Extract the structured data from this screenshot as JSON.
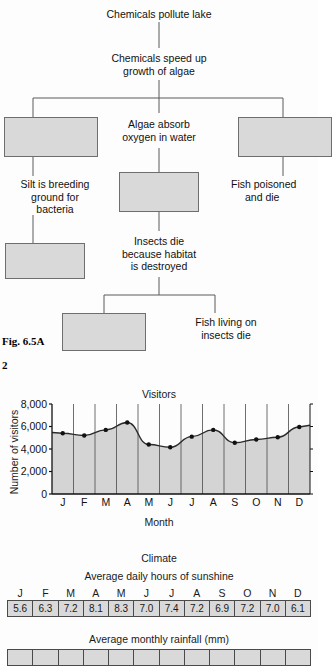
{
  "figure": {
    "caption": "Fig. 6.5A",
    "question_number": "2"
  },
  "flowchart": {
    "nodes": [
      {
        "id": "n1",
        "text": "Chemicals pollute lake"
      },
      {
        "id": "n2",
        "line1": "Chemicals speed up",
        "line2": "growth of algae"
      },
      {
        "id": "n3",
        "line1": "Algae absorb",
        "line2": "oxygen in water"
      },
      {
        "id": "n4",
        "line1": "Silt is breeding",
        "line2": "ground for",
        "line3": "bacteria"
      },
      {
        "id": "n5",
        "line1": "Fish poisoned",
        "line2": "and die"
      },
      {
        "id": "n6",
        "line1": "Insects die",
        "line2": "because habitat",
        "line3": "is destroyed"
      },
      {
        "id": "n7",
        "line1": "Fish living on",
        "line2": "insects die"
      }
    ],
    "answer_boxes": [
      {
        "id": "box-left-top"
      },
      {
        "id": "box-right-top"
      },
      {
        "id": "box-center-mid"
      },
      {
        "id": "box-left-lower"
      },
      {
        "id": "box-bottom"
      }
    ]
  },
  "chart_data": {
    "type": "line",
    "title": "Visitors",
    "xlabel": "Month",
    "ylabel": "Number of visitors",
    "categories": [
      "J",
      "F",
      "M",
      "A",
      "M",
      "J",
      "J",
      "A",
      "S",
      "O",
      "N",
      "D"
    ],
    "values": [
      5400,
      5200,
      5700,
      6350,
      4400,
      4150,
      5100,
      5700,
      4550,
      4850,
      5050,
      5950
    ],
    "ylim": [
      0,
      8000
    ],
    "yticks": [
      0,
      2000,
      4000,
      6000,
      8000
    ],
    "ytick_labels": [
      "0",
      "2,000",
      "4,000",
      "6,000",
      "8,000"
    ],
    "grid": true,
    "fill": true,
    "fill_color": "#d4d4d4",
    "line_color": "#2b2b2b",
    "marker": "circle"
  },
  "climate": {
    "section_title": "Climate",
    "sunshine": {
      "title": "Average daily hours of sunshine",
      "months": [
        "J",
        "F",
        "M",
        "A",
        "M",
        "J",
        "J",
        "A",
        "S",
        "O",
        "N",
        "D"
      ],
      "values": [
        "5.6",
        "6.3",
        "7.2",
        "8.1",
        "8.3",
        "7.0",
        "7.4",
        "7.2",
        "6.9",
        "7.2",
        "7.0",
        "6.1"
      ]
    },
    "rainfall": {
      "title": "Average monthly rainfall (mm)",
      "values": [
        "",
        "",
        "",
        "",
        "",
        "",
        "",
        "",
        "",
        "",
        "",
        ""
      ]
    }
  }
}
